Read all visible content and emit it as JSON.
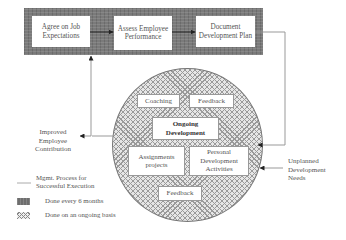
{
  "process_band": {
    "steps": [
      {
        "label": "Agree on Job Expectations"
      },
      {
        "label": "Assess Employee Performance"
      },
      {
        "label": "Document Development Plan"
      }
    ]
  },
  "ongoing_circle": {
    "center": {
      "label": "Ongoing Development"
    },
    "items": [
      {
        "label": "Coaching"
      },
      {
        "label": "Feedback"
      },
      {
        "label": "Assignments projects"
      },
      {
        "label": "Personal Development Activities"
      },
      {
        "label": "Feedback"
      }
    ]
  },
  "outputs": {
    "left": "Improved Employee Contribution",
    "right": "Unplanned Development Needs"
  },
  "legend": {
    "items": [
      {
        "label": "Mgmt. Process for Successful Execution",
        "swatch": "line"
      },
      {
        "label": "Done every 6 months",
        "swatch": "gray-texture"
      },
      {
        "label": "Done on an ongoing basis",
        "swatch": "crosshatch"
      }
    ]
  },
  "colors": {
    "band": "#7a7a7a",
    "line": "#999999",
    "arrow": "#222222"
  }
}
